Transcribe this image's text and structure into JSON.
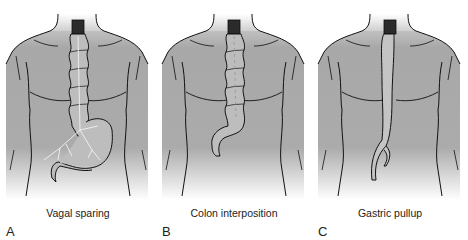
{
  "figure": {
    "panels": [
      {
        "letter": "A",
        "caption": "Vagal sparing",
        "conduit": "colon-with-stomach",
        "x": 0
      },
      {
        "letter": "B",
        "caption": "Colon interposition",
        "conduit": "colon",
        "x": 156
      },
      {
        "letter": "C",
        "caption": "Gastric pullup",
        "conduit": "stomach-tube",
        "x": 312
      }
    ],
    "colors": {
      "body_fill": "#a9a9a9",
      "body_fade": "#ffffff",
      "neck_fill": "#e4e4e4",
      "esophagus_remnant": "#2b2b2b",
      "conduit_fill": "#bdbdbd",
      "outline": "#111111",
      "nerve": "#f2f2f2"
    }
  }
}
